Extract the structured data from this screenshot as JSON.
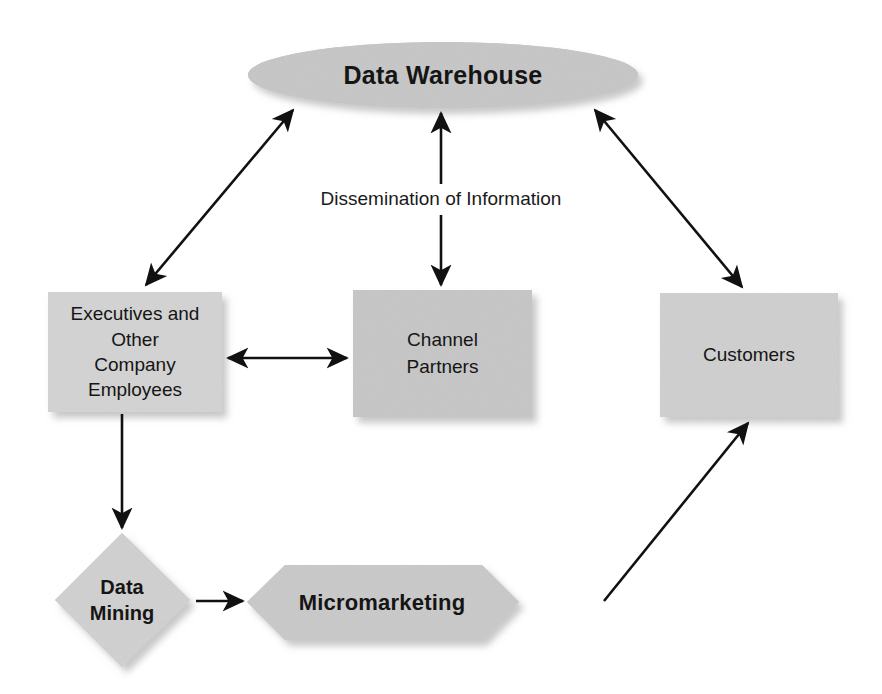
{
  "diagram": {
    "colors": {
      "shape_fill": "#c6c6c6",
      "shape_fill_light": "#d2d2d2",
      "shadow": "#bfbfbf",
      "line": "#111111",
      "background": "#ffffff",
      "text": "#151515"
    },
    "nodes": [
      {
        "id": "data-warehouse",
        "label": "Data Warehouse",
        "shape": "ellipse",
        "bold": true
      },
      {
        "id": "executives",
        "label": "Executives and\nOther\nCompany\nEmployees",
        "shape": "rectangle",
        "bold": false
      },
      {
        "id": "channel-partners",
        "label": "Channel\nPartners",
        "shape": "rectangle",
        "bold": false
      },
      {
        "id": "customers",
        "label": "Customers",
        "shape": "rectangle",
        "bold": false
      },
      {
        "id": "data-mining",
        "label": "Data\nMining",
        "shape": "diamond",
        "bold": true
      },
      {
        "id": "micromarketing",
        "label": "Micromarketing",
        "shape": "hexagon",
        "bold": true
      }
    ],
    "edges": [
      {
        "id": "warehouse-executives",
        "from": "data-warehouse",
        "to": "executives",
        "direction": "bidirectional",
        "label": ""
      },
      {
        "id": "warehouse-channel",
        "from": "data-warehouse",
        "to": "channel-partners",
        "direction": "bidirectional",
        "label": "Dissemination of Information"
      },
      {
        "id": "warehouse-customers",
        "from": "data-warehouse",
        "to": "customers",
        "direction": "bidirectional",
        "label": ""
      },
      {
        "id": "executives-channel",
        "from": "executives",
        "to": "channel-partners",
        "direction": "bidirectional",
        "label": ""
      },
      {
        "id": "executives-mining",
        "from": "executives",
        "to": "data-mining",
        "direction": "forward",
        "label": ""
      },
      {
        "id": "mining-micromarketing",
        "from": "data-mining",
        "to": "micromarketing",
        "direction": "forward",
        "label": ""
      },
      {
        "id": "micromarketing-customers",
        "from": "micromarketing",
        "to": "customers",
        "direction": "forward",
        "label": ""
      }
    ],
    "edge_labels": {
      "dissemination": "Dissemination of Information"
    }
  }
}
